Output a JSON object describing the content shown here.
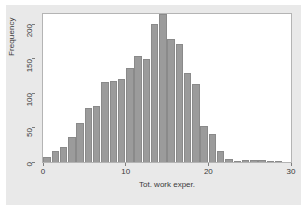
{
  "chart_data": {
    "type": "bar",
    "title": "",
    "subtitle": "",
    "xlabel": "Tot. work exper.",
    "ylabel": "Frequency",
    "xlim": [
      0,
      30
    ],
    "ylim": [
      0,
      215
    ],
    "grid": false,
    "legend": null,
    "bar_color": "#9b9b9b",
    "bar_edge_color": "#8a8a8a",
    "panel_background": "#ffffff",
    "figure_background": "#e9e9e9",
    "bin_width": 1,
    "x_ticks": [
      0,
      10,
      20,
      30
    ],
    "x_tick_labels": [
      "0",
      "10",
      "20",
      "30"
    ],
    "y_ticks": [
      0,
      50,
      100,
      150,
      200
    ],
    "y_tick_labels": [
      "0",
      "50",
      "100",
      "150",
      "200"
    ],
    "categories": [
      "0",
      "1",
      "2",
      "3",
      "4",
      "5",
      "6",
      "7",
      "8",
      "9",
      "10",
      "11",
      "12",
      "13",
      "14",
      "15",
      "16",
      "17",
      "18",
      "19",
      "20",
      "21",
      "22",
      "23",
      "24",
      "25",
      "26",
      "27",
      "28"
    ],
    "bin_starts": [
      0,
      1,
      2,
      3,
      4,
      5,
      6,
      7,
      8,
      9,
      10,
      11,
      12,
      13,
      14,
      15,
      16,
      17,
      18,
      19,
      20,
      21,
      22,
      23,
      24,
      25,
      26,
      27,
      28
    ],
    "values": [
      8,
      16,
      22,
      36,
      57,
      78,
      82,
      116,
      118,
      120,
      136,
      154,
      150,
      200,
      215,
      178,
      171,
      130,
      113,
      52,
      40,
      16,
      4,
      1,
      3,
      3,
      3,
      2,
      2
    ]
  }
}
